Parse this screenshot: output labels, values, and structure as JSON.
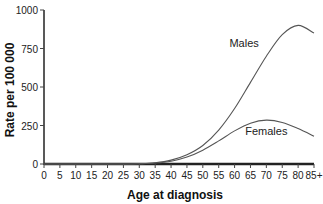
{
  "chart_data": {
    "type": "line",
    "title": "",
    "xlabel": "Age at diagnosis",
    "ylabel": "Rate per 100 000",
    "ylim": [
      0,
      1000
    ],
    "yticks": [
      "0",
      "250",
      "500",
      "750",
      "1000"
    ],
    "categories": [
      "0",
      "5",
      "10",
      "15",
      "20",
      "25",
      "30",
      "35",
      "40",
      "45",
      "50",
      "55",
      "60",
      "65",
      "70",
      "75",
      "80",
      "85+"
    ],
    "grid": false,
    "legend": "inline labels",
    "series": [
      {
        "name": "Males",
        "values": [
          0,
          0,
          0,
          0,
          0,
          0,
          2,
          8,
          25,
          60,
          120,
          220,
          360,
          530,
          700,
          840,
          900,
          850
        ]
      },
      {
        "name": "Females",
        "values": [
          0,
          0,
          0,
          0,
          0,
          0,
          2,
          6,
          18,
          45,
          90,
          150,
          215,
          265,
          285,
          270,
          230,
          180
        ]
      }
    ],
    "annotations": [
      {
        "text": "Males",
        "x_age": 63,
        "y": 760
      },
      {
        "text": "Females",
        "x_age": 70,
        "y": 190
      }
    ]
  }
}
